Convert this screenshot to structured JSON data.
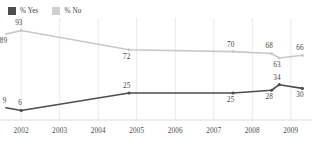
{
  "legend": {
    "items": [
      {
        "label": "% Yes",
        "color": "#4d4d4d",
        "icon": "square-swatch"
      },
      {
        "label": "% No",
        "color": "#cfcfcf",
        "icon": "square-swatch"
      }
    ]
  },
  "axis": {
    "ticks": [
      "2002",
      "2003",
      "2004",
      "2005",
      "2006",
      "2007",
      "2008",
      "2009"
    ]
  },
  "colors": {
    "yes_line": "#4d4d4d",
    "no_line": "#c8c8c8",
    "gridline": "#e9e9e9",
    "axis_line": "#dcdcdc",
    "label_text": "#444444",
    "background": "#ffffff"
  },
  "chart_data": {
    "type": "line",
    "title": "",
    "xlabel": "",
    "ylabel": "",
    "grid": "vertical",
    "legend_position": "top-left",
    "ylim": [
      0,
      100
    ],
    "categories": [
      "2002",
      "2003",
      "2004",
      "2005",
      "2006",
      "2007",
      "2008",
      "2009"
    ],
    "series": [
      {
        "name": "% Yes",
        "color": "#4d4d4d",
        "points": [
          {
            "x": 2001.6,
            "y": 9,
            "label": "9",
            "label_pos": "above"
          },
          {
            "x": 2002.0,
            "y": 6,
            "label": "6",
            "label_pos": "above"
          },
          {
            "x": 2004.8,
            "y": 25,
            "label": "25",
            "label_pos": "above"
          },
          {
            "x": 2007.5,
            "y": 25,
            "label": "25",
            "label_pos": "below"
          },
          {
            "x": 2008.5,
            "y": 28,
            "label": "28",
            "label_pos": "below"
          },
          {
            "x": 2008.7,
            "y": 34,
            "label": "34",
            "label_pos": "above"
          },
          {
            "x": 2009.3,
            "y": 30,
            "label": "30",
            "label_pos": "below"
          }
        ]
      },
      {
        "name": "% No",
        "color": "#c8c8c8",
        "points": [
          {
            "x": 2001.6,
            "y": 89,
            "label": "89",
            "label_pos": "below"
          },
          {
            "x": 2002.0,
            "y": 93,
            "label": "93",
            "label_pos": "above"
          },
          {
            "x": 2004.8,
            "y": 72,
            "label": "72",
            "label_pos": "below"
          },
          {
            "x": 2007.5,
            "y": 70,
            "label": "70",
            "label_pos": "above"
          },
          {
            "x": 2008.5,
            "y": 68,
            "label": "68",
            "label_pos": "above"
          },
          {
            "x": 2008.7,
            "y": 63,
            "label": "63",
            "label_pos": "below"
          },
          {
            "x": 2009.3,
            "y": 66,
            "label": "66",
            "label_pos": "above"
          }
        ]
      }
    ]
  }
}
